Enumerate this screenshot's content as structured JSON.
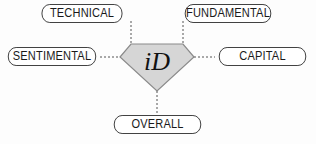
{
  "diagram": {
    "center": {
      "label": "iD",
      "shape": "diamond",
      "fill": "#d6d6d6",
      "stroke": "#8a8a8a"
    },
    "nodes": [
      {
        "id": "technical",
        "label": "TECHNICAL"
      },
      {
        "id": "fundamental",
        "label": "FUNDAMENTAL"
      },
      {
        "id": "sentimental",
        "label": "SENTIMENTAL"
      },
      {
        "id": "capital",
        "label": "CAPITAL"
      },
      {
        "id": "overall",
        "label": "OVERALL"
      }
    ],
    "connector_style": "dashed",
    "connector_color": "#555555"
  }
}
